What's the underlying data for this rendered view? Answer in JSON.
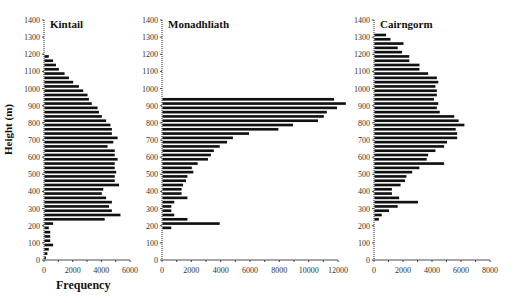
{
  "figure": {
    "ylabel": "Height (m)",
    "xlabel": "Frequency"
  },
  "chart_data": [
    {
      "type": "bar",
      "orientation": "horizontal",
      "title": "Kintail",
      "xlabel": "Frequency",
      "ylabel": "Height (m)",
      "xlim": [
        0,
        6000
      ],
      "ylim": [
        0,
        1400
      ],
      "xticks": [
        0,
        2000,
        4000,
        6000
      ],
      "yticks": [
        0,
        100,
        200,
        300,
        400,
        500,
        600,
        700,
        800,
        900,
        1000,
        1100,
        1200,
        1300,
        1400
      ],
      "bin_width_m": 25,
      "heights": [
        0,
        25,
        50,
        75,
        100,
        125,
        150,
        175,
        200,
        225,
        250,
        275,
        300,
        325,
        350,
        375,
        400,
        425,
        450,
        475,
        500,
        525,
        550,
        575,
        600,
        625,
        650,
        675,
        700,
        725,
        750,
        775,
        800,
        825,
        850,
        875,
        900,
        925,
        950,
        975,
        1000,
        1025,
        1050,
        1075,
        1100,
        1125,
        1150,
        1175
      ],
      "values": [
        100,
        200,
        300,
        600,
        400,
        400,
        400,
        300,
        600,
        4200,
        5300,
        4700,
        4500,
        4700,
        4300,
        4000,
        4100,
        5200,
        4900,
        4900,
        5000,
        4900,
        4900,
        5100,
        4900,
        4900,
        4400,
        4800,
        5100,
        4700,
        4700,
        4600,
        4300,
        4000,
        3800,
        3700,
        3300,
        3100,
        3000,
        2700,
        2400,
        2000,
        1700,
        1400,
        1000,
        800,
        600,
        300
      ]
    },
    {
      "type": "bar",
      "orientation": "horizontal",
      "title": "Monadhliath",
      "xlim": [
        0,
        12000
      ],
      "ylim": [
        0,
        1400
      ],
      "xticks": [
        0,
        2000,
        4000,
        6000,
        8000,
        10000,
        12000
      ],
      "yticks": [
        0,
        100,
        200,
        300,
        400,
        500,
        600,
        700,
        800,
        900,
        1000,
        1100,
        1200,
        1300,
        1400
      ],
      "bin_width_m": 25,
      "heights": [
        175,
        200,
        225,
        250,
        275,
        300,
        325,
        350,
        375,
        400,
        425,
        450,
        475,
        500,
        525,
        550,
        575,
        600,
        625,
        650,
        675,
        700,
        725,
        750,
        775,
        800,
        825,
        850,
        875,
        900,
        925
      ],
      "values": [
        600,
        3900,
        1700,
        800,
        600,
        600,
        800,
        1700,
        1300,
        1300,
        1400,
        1600,
        1700,
        2100,
        2000,
        2400,
        3100,
        3300,
        3500,
        3900,
        4400,
        4800,
        5900,
        7900,
        8900,
        10600,
        11000,
        11200,
        11900,
        12500,
        11700
      ]
    },
    {
      "type": "bar",
      "orientation": "horizontal",
      "title": "Cairngorm",
      "xlim": [
        0,
        8000
      ],
      "ylim": [
        0,
        1400
      ],
      "xticks": [
        0,
        2000,
        4000,
        6000,
        8000
      ],
      "yticks": [
        0,
        100,
        200,
        300,
        400,
        500,
        600,
        700,
        800,
        900,
        1000,
        1100,
        1200,
        1300,
        1400
      ],
      "bin_width_m": 25,
      "heights": [
        225,
        250,
        275,
        300,
        325,
        350,
        375,
        400,
        425,
        450,
        475,
        500,
        525,
        550,
        575,
        600,
        625,
        650,
        675,
        700,
        725,
        750,
        775,
        800,
        825,
        850,
        875,
        900,
        925,
        950,
        975,
        1000,
        1025,
        1050,
        1075,
        1100,
        1125,
        1150,
        1175,
        1200,
        1225,
        1250,
        1275,
        1300
      ],
      "values": [
        300,
        500,
        1000,
        1600,
        3000,
        1700,
        1200,
        1200,
        1800,
        2100,
        2200,
        2600,
        3100,
        4800,
        3600,
        3700,
        4200,
        4800,
        5000,
        5700,
        5700,
        5600,
        6200,
        5800,
        5500,
        4500,
        4300,
        4400,
        4100,
        4300,
        4300,
        4200,
        4400,
        4300,
        3700,
        3100,
        3100,
        2400,
        2400,
        1900,
        1600,
        2000,
        1100,
        800
      ]
    }
  ]
}
